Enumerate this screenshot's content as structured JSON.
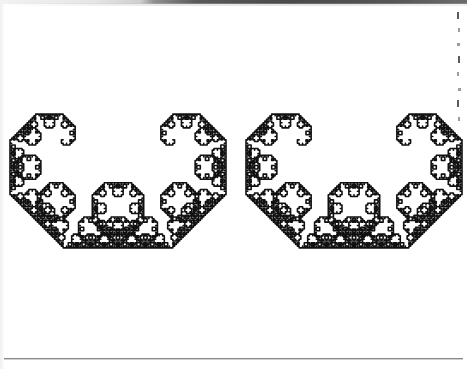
{
  "page": {
    "kind": "scanned-book-page",
    "width": 467,
    "height": 369,
    "background_color": "#ffffff",
    "ink_color": "#111111",
    "scan_band": {
      "present": true,
      "position": "top",
      "height_px": 4,
      "color_left": "#e6e6e6",
      "color_right": "#4a4a4a"
    },
    "bottom_rule": {
      "present": true,
      "y": 358,
      "x_start": 4,
      "x_end": 463,
      "color": "#8a8a8a"
    },
    "right_margin_text_sliver": {
      "present": true,
      "description": "clipped left edges of a neighbouring text column",
      "x": 455,
      "y_start": 8,
      "y_end": 126,
      "color": "#4a4a4a",
      "line_count": 8
    }
  },
  "figure": {
    "name": "levy-c-curve",
    "type": "fractal-curve",
    "stroke_color": "#111111",
    "stroke_width": 1.6,
    "stroke_linecap": "round",
    "stroke_linejoin": "round",
    "fill": "none",
    "iterations": 12,
    "turn_angle_deg": 45,
    "scale_factor": 0.7071067812,
    "copies": 2,
    "copy_offsets_x": [
      0,
      236
    ],
    "base_segment": {
      "x1": 74,
      "y1": 181,
      "x2": 216,
      "y2": 181,
      "length": 142
    },
    "viewbox": "0 0 467 369",
    "bounds": {
      "x_min": 10,
      "x_max": 442,
      "y_min": 10,
      "y_max": 352
    },
    "axis_visible": false,
    "grid_visible": false,
    "labels_visible": false,
    "legend_visible": false
  },
  "chart_data": {
    "type": "line",
    "subtitle": "",
    "xlabel": "",
    "ylabel": "",
    "curve_family": "Levy C curve (Levy dragon)",
    "construction_rule": "F -> +F--F+",
    "turn_angle_deg": 45,
    "iterations": 12,
    "segment_count_per_copy": 4096,
    "self_similarity_ratio": 0.7071067812,
    "hausdorff_dimension": 2.0,
    "copies_rendered": 2,
    "series": [
      {
        "name": "levy-c-curve-copy-1",
        "start": [
          74,
          181
        ],
        "end": [
          216,
          181
        ],
        "origin_x_offset": 0
      },
      {
        "name": "levy-c-curve-copy-2",
        "start": [
          310,
          181
        ],
        "end": [
          452,
          181
        ],
        "origin_x_offset": 236
      }
    ],
    "xlim": [
      0,
      467
    ],
    "ylim": [
      0,
      369
    ],
    "grid": false,
    "legend": false,
    "axes": false,
    "annotations": []
  }
}
